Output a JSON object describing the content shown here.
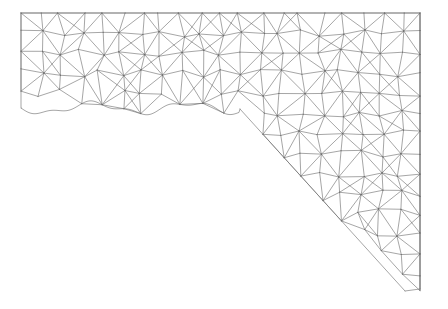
{
  "figure": {
    "type": "mesh-plot",
    "title": "",
    "width": 448,
    "height": 309,
    "background_color": "#ffffff"
  },
  "chart_data": {
    "type": "mesh",
    "title": "",
    "subtitle": "",
    "xlabel": "",
    "ylabel": "",
    "grid": false,
    "legend": null,
    "axes_visible": false,
    "tick_labels_x": [],
    "tick_labels_y": [],
    "domain": {
      "shape": "L-shaped-wedge",
      "outline": [
        [
          21,
          13
        ],
        [
          420,
          13
        ],
        [
          420,
          262
        ],
        [
          405,
          291
        ],
        [
          240,
          109
        ],
        [
          21,
          112
        ]
      ],
      "x_range": [
        21,
        420
      ],
      "y_range": [
        13,
        291
      ]
    },
    "mesh": {
      "nominal_spacing": 20,
      "node_jitter": 4.2,
      "line_color": "#6a6a6a",
      "line_width": 0.6,
      "triangulation": "quad-split-with-alternating-diagonals",
      "extra_diagonal_probability": 0.34,
      "node_count_estimate": 470,
      "triangle_count_estimate": 860,
      "random_seed": 20240613,
      "boundary_wave": {
        "lower_arm_base_y": 108,
        "amplitude": 5,
        "wavelength": 96
      }
    }
  }
}
